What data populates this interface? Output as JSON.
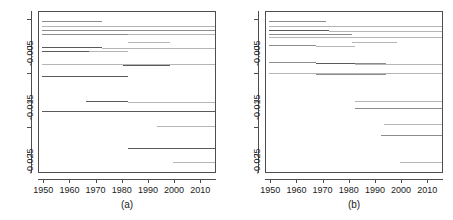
{
  "figure": {
    "width": 453,
    "height": 220,
    "background": "#ffffff",
    "line_color": "#8c8c8c",
    "line_color_dark": "#5a5a5a",
    "line_color_light": "#b5b5b5",
    "axis_color": "#4d4d4d"
  },
  "chart_data": [
    {
      "type": "line",
      "title": "",
      "caption": "(a)",
      "xlabel": "",
      "ylabel": "",
      "grid": false,
      "legend": null,
      "xlim": [
        1948,
        2016
      ],
      "ylim": [
        -0.0285,
        0.0015
      ],
      "xticks": [
        1950,
        1960,
        1970,
        1980,
        1990,
        2000,
        2010
      ],
      "xticklabels": [
        "1950",
        "1960",
        "1970",
        "1980",
        "1990",
        "2000",
        "2010"
      ],
      "yticks": [
        -0.025,
        -0.02,
        -0.015,
        -0.01,
        -0.005,
        0.0
      ],
      "yticklabels": [
        "-0.025",
        "",
        "-0.015",
        "",
        "-0.005",
        ""
      ],
      "series": [
        {
          "name": "s1",
          "y": -0.0002,
          "x_start": 1949,
          "x_end": 1972,
          "shade": "mid"
        },
        {
          "name": "s2",
          "y": -0.001,
          "x_start": 1949,
          "x_end": 2016,
          "shade": "light"
        },
        {
          "name": "s3",
          "y": -0.0018,
          "x_start": 1949,
          "x_end": 2016,
          "shade": "mid"
        },
        {
          "name": "s4",
          "y": -0.0025,
          "x_start": 1949,
          "x_end": 1982,
          "shade": "mid"
        },
        {
          "name": "s5",
          "y": -0.0026,
          "x_start": 1982,
          "x_end": 2016,
          "shade": "light"
        },
        {
          "name": "s6",
          "y": -0.004,
          "x_start": 1982,
          "x_end": 1998,
          "shade": "light"
        },
        {
          "name": "s7",
          "y": -0.005,
          "x_start": 1949,
          "x_end": 1972,
          "shade": "dark"
        },
        {
          "name": "s8",
          "y": -0.0052,
          "x_start": 1972,
          "x_end": 2016,
          "shade": "light"
        },
        {
          "name": "s9",
          "y": -0.0057,
          "x_start": 1949,
          "x_end": 1967,
          "shade": "dark"
        },
        {
          "name": "s10",
          "y": -0.0058,
          "x_start": 1967,
          "x_end": 1982,
          "shade": "light"
        },
        {
          "name": "s11",
          "y": -0.0082,
          "x_start": 1949,
          "x_end": 2016,
          "shade": "light"
        },
        {
          "name": "s12",
          "y": -0.0083,
          "x_start": 1980,
          "x_end": 1997,
          "shade": "dark"
        },
        {
          "name": "s13",
          "y": -0.0084,
          "x_start": 1983,
          "x_end": 1998,
          "shade": "dark"
        },
        {
          "name": "s14",
          "y": -0.0103,
          "x_start": 1949,
          "x_end": 1982,
          "shade": "dark"
        },
        {
          "name": "s15",
          "y": -0.015,
          "x_start": 1966,
          "x_end": 1982,
          "shade": "dark"
        },
        {
          "name": "s16",
          "y": -0.0151,
          "x_start": 1982,
          "x_end": 2016,
          "shade": "light"
        },
        {
          "name": "s17",
          "y": -0.0168,
          "x_start": 1949,
          "x_end": 2016,
          "shade": "dark"
        },
        {
          "name": "s18",
          "y": -0.0196,
          "x_start": 1993,
          "x_end": 2016,
          "shade": "light"
        },
        {
          "name": "s19",
          "y": -0.0237,
          "x_start": 1982,
          "x_end": 2016,
          "shade": "dark"
        },
        {
          "name": "s20",
          "y": -0.0263,
          "x_start": 1999,
          "x_end": 2016,
          "shade": "light"
        }
      ]
    },
    {
      "type": "line",
      "title": "",
      "caption": "(b)",
      "xlabel": "",
      "ylabel": "",
      "grid": false,
      "legend": null,
      "xlim": [
        1948,
        2016
      ],
      "ylim": [
        -0.0285,
        0.0015
      ],
      "xticks": [
        1950,
        1960,
        1970,
        1980,
        1990,
        2000,
        2010
      ],
      "xticklabels": [
        "1950",
        "1960",
        "1970",
        "1980",
        "1990",
        "2000",
        "2010"
      ],
      "yticks": [
        -0.025,
        -0.02,
        -0.015,
        -0.01,
        -0.005,
        0.0
      ],
      "yticklabels": [
        "-0.025",
        "",
        "-0.015",
        "",
        "-0.005",
        ""
      ],
      "series": [
        {
          "name": "t1",
          "y": -0.0002,
          "x_start": 1949,
          "x_end": 1971,
          "shade": "mid"
        },
        {
          "name": "t2",
          "y": -0.0011,
          "x_start": 1949,
          "x_end": 2016,
          "shade": "light"
        },
        {
          "name": "t3",
          "y": -0.0019,
          "x_start": 1949,
          "x_end": 1972,
          "shade": "dark"
        },
        {
          "name": "t4",
          "y": -0.002,
          "x_start": 1972,
          "x_end": 2016,
          "shade": "light"
        },
        {
          "name": "t5",
          "y": -0.0025,
          "x_start": 1949,
          "x_end": 1981,
          "shade": "mid"
        },
        {
          "name": "t6",
          "y": -0.0032,
          "x_start": 1949,
          "x_end": 2016,
          "shade": "light"
        },
        {
          "name": "t7",
          "y": -0.004,
          "x_start": 1981,
          "x_end": 1998,
          "shade": "light"
        },
        {
          "name": "t8",
          "y": -0.0047,
          "x_start": 1949,
          "x_end": 1967,
          "shade": "mid"
        },
        {
          "name": "t9",
          "y": -0.0048,
          "x_start": 1967,
          "x_end": 1982,
          "shade": "light"
        },
        {
          "name": "t10",
          "y": -0.0078,
          "x_start": 1949,
          "x_end": 1967,
          "shade": "mid"
        },
        {
          "name": "t11",
          "y": -0.0079,
          "x_start": 1967,
          "x_end": 1982,
          "shade": "dark"
        },
        {
          "name": "t12",
          "y": -0.008,
          "x_start": 1982,
          "x_end": 1994,
          "shade": "mid"
        },
        {
          "name": "t13",
          "y": -0.0081,
          "x_start": 1982,
          "x_end": 2016,
          "shade": "light"
        },
        {
          "name": "t14",
          "y": -0.0098,
          "x_start": 1949,
          "x_end": 2016,
          "shade": "light"
        },
        {
          "name": "t15",
          "y": -0.0099,
          "x_start": 1967,
          "x_end": 1994,
          "shade": "mid"
        },
        {
          "name": "t16",
          "y": -0.0149,
          "x_start": 1982,
          "x_end": 2016,
          "shade": "light"
        },
        {
          "name": "t17",
          "y": -0.0162,
          "x_start": 1982,
          "x_end": 2016,
          "shade": "mid"
        },
        {
          "name": "t18",
          "y": -0.0193,
          "x_start": 1993,
          "x_end": 2016,
          "shade": "light"
        },
        {
          "name": "t19",
          "y": -0.0213,
          "x_start": 1992,
          "x_end": 2016,
          "shade": "mid"
        },
        {
          "name": "t20",
          "y": -0.0263,
          "x_start": 1999,
          "x_end": 2016,
          "shade": "light"
        }
      ]
    }
  ]
}
